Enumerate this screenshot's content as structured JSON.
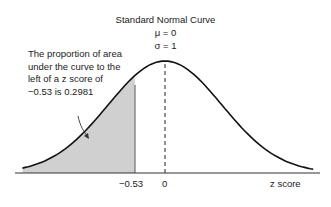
{
  "chart_data": {
    "type": "area",
    "title": "Standard Normal Curve",
    "parameters": {
      "mu": "μ = 0",
      "sigma": "σ = 1"
    },
    "xlabel": "z score",
    "ylabel": "",
    "tick_labels": [
      "−0.53",
      "0"
    ],
    "ticks": [
      -0.53,
      0
    ],
    "shaded_region": {
      "from": -3,
      "to": -0.53,
      "area": 0.2981,
      "color": "#d0d0d0"
    },
    "mean_line": {
      "x": 0,
      "style": "dashed"
    },
    "annotation": "The proportion of area under the curve to the left of a z score of −0.53 is 0.2981",
    "xlim": [
      -2.6,
      2.7
    ],
    "grid": false,
    "legend": "none"
  },
  "labels": {
    "title": "Standard Normal Curve",
    "mu": "μ = 0",
    "sigma": "σ = 1",
    "note": "The proportion of area under the curve to the left of a z score of −0.53 is 0.2981",
    "tick1": "−0.53",
    "tick2": "0",
    "xlabel": "z score"
  }
}
